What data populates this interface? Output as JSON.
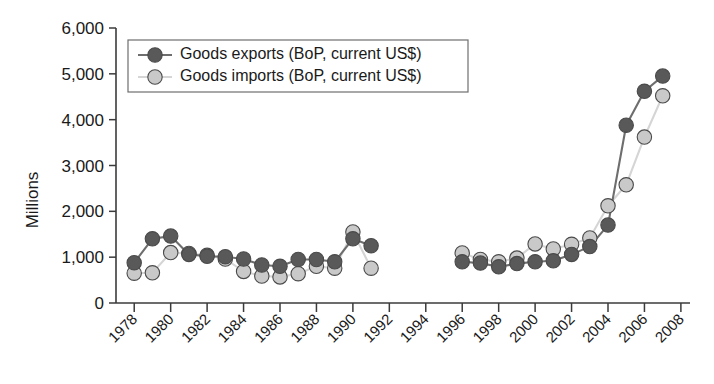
{
  "chart_data": {
    "type": "line",
    "title": "",
    "xlabel": "",
    "ylabel": "Millions",
    "xlim": [
      1977,
      2008.5
    ],
    "ylim": [
      0,
      6000
    ],
    "ytick_labels": [
      "0",
      "1,000",
      "2,000",
      "3,000",
      "4,000",
      "5,000",
      "6,000"
    ],
    "ytick_values": [
      0,
      1000,
      2000,
      3000,
      4000,
      5000,
      6000
    ],
    "xtick_labels": [
      "1978",
      "1980",
      "1982",
      "1984",
      "1986",
      "1988",
      "1990",
      "1992",
      "1994",
      "1996",
      "1998",
      "2000",
      "2002",
      "2004",
      "2006",
      "2008"
    ],
    "xtick_values": [
      1978,
      1980,
      1982,
      1984,
      1986,
      1988,
      1990,
      1992,
      1994,
      1996,
      1998,
      2000,
      2002,
      2004,
      2006,
      2008
    ],
    "grid": false,
    "legend_position": "upper left",
    "gap_years": [
      1992,
      1993,
      1994,
      1995
    ],
    "series": [
      {
        "name": "Goods exports (BoP, current US$)",
        "color": "#595959",
        "line_color": "#6e6e6e",
        "x": [
          1978,
          1979,
          1980,
          1981,
          1982,
          1983,
          1984,
          1985,
          1986,
          1987,
          1988,
          1989,
          1990,
          1991,
          1996,
          1997,
          1998,
          1999,
          2000,
          2001,
          2002,
          2003,
          2004,
          2005,
          2006,
          2007
        ],
        "values": [
          880,
          1400,
          1460,
          1060,
          1020,
          1010,
          960,
          830,
          800,
          950,
          950,
          900,
          1400,
          1250,
          900,
          870,
          790,
          860,
          900,
          920,
          1060,
          1230,
          1700,
          3880,
          4620,
          4950
        ]
      },
      {
        "name": "Goods imports (BoP, current US$)",
        "color": "#c9c9c9",
        "line_color": "#d5d5d5",
        "x": [
          1978,
          1979,
          1980,
          1981,
          1982,
          1983,
          1984,
          1985,
          1986,
          1987,
          1988,
          1989,
          1990,
          1991,
          1996,
          1997,
          1998,
          1999,
          2000,
          2001,
          2002,
          2003,
          2004,
          2005,
          2006,
          2007
        ],
        "values": [
          650,
          660,
          1100,
          1080,
          1040,
          960,
          690,
          590,
          570,
          640,
          800,
          760,
          1550,
          760,
          1090,
          950,
          900,
          980,
          1290,
          1180,
          1280,
          1420,
          2120,
          2580,
          3620,
          4520
        ]
      }
    ]
  },
  "legend": {
    "entries": [
      {
        "label": "Goods exports (BoP, current US$)",
        "marker": "dark-circle-marker"
      },
      {
        "label": "Goods imports (BoP, current US$)",
        "marker": "light-circle-marker"
      }
    ]
  },
  "axes": {
    "y_axis_title": "Millions"
  },
  "colors": {
    "exports": "#595959",
    "imports": "#c9c9c9",
    "axis": "#3b3b3b",
    "background": "#ffffff"
  }
}
